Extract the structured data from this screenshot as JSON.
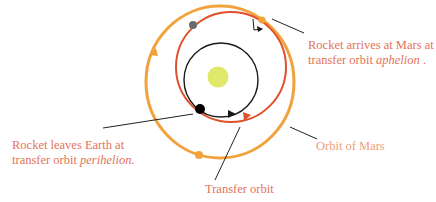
{
  "colors": {
    "sun": "#dfe86a",
    "earth_orbit": "#1a1a1a",
    "transfer_orbit": "#e0502a",
    "mars_orbit": "#f2a23c",
    "earth": "#000000",
    "mars_start": "#6b6b6b",
    "label_text": "#e4725a",
    "leader_line": "#222222"
  },
  "labels": {
    "arrival": {
      "line1": "Rocket arrives at Mars at",
      "line2_prefix": "transfer orbit ",
      "line2_italic": "aphelion",
      "line2_suffix": " ."
    },
    "departure": {
      "line1": "Rocket leaves Earth at",
      "line2_prefix": "transfer orbit ",
      "line2_italic": "perihelion."
    },
    "mars_orbit": "Orbit of Mars",
    "transfer_orbit": "Transfer orbit"
  },
  "bodies": [
    {
      "name": "Sun",
      "role": "center"
    },
    {
      "name": "Earth",
      "role": "departure point (perihelion)"
    },
    {
      "name": "Mars (at launch)",
      "role": "initial Mars position"
    },
    {
      "name": "Mars (at arrival)",
      "role": "arrival point (aphelion)"
    },
    {
      "name": "Mars (later)",
      "role": "orbit marker"
    }
  ]
}
